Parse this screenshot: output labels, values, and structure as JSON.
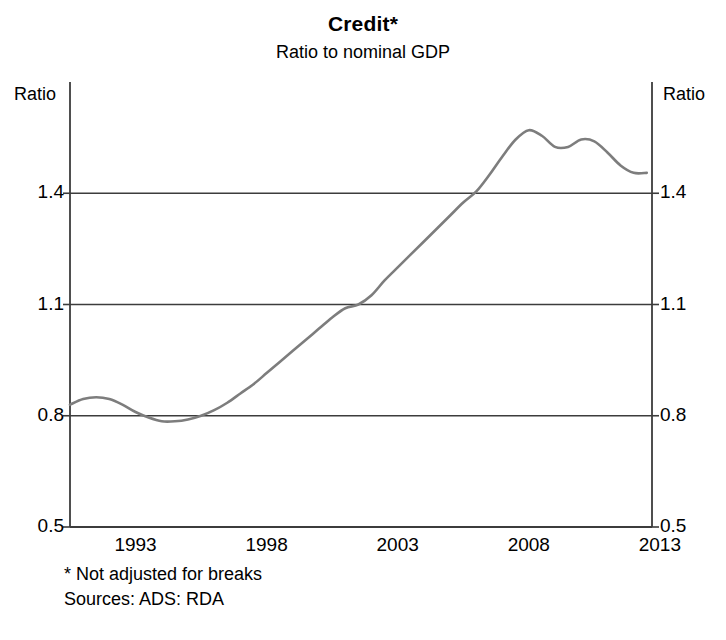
{
  "chart_data": {
    "type": "line",
    "title": "Credit*",
    "subtitle": "Ratio to nominal GDP",
    "xlabel": "",
    "ylabel": "Ratio",
    "ylabel_right": "Ratio",
    "xlim": [
      1990.5,
      2012.7
    ],
    "ylim": [
      0.5,
      1.7
    ],
    "yticks": [
      0.5,
      0.8,
      1.1,
      1.4
    ],
    "ytick_labels": [
      "0.5",
      "0.8",
      "1.1",
      "1.4"
    ],
    "xticks": [
      1993,
      1998,
      2003,
      2008,
      2013
    ],
    "xtick_labels": [
      "1993",
      "1998",
      "2003",
      "2008",
      "2013"
    ],
    "gridlines": "horizontal-at-yticks",
    "legend": "none",
    "line_color": "#7d7d7d",
    "axis_color": "#3c3c3c",
    "series": [
      {
        "name": "Credit to nominal GDP ratio",
        "x": [
          1990.5,
          1991.0,
          1991.5,
          1992.0,
          1992.5,
          1993.0,
          1993.5,
          1994.0,
          1994.5,
          1995.0,
          1995.5,
          1996.0,
          1996.5,
          1997.0,
          1997.5,
          1998.0,
          1998.5,
          1999.0,
          1999.5,
          2000.0,
          2000.5,
          2001.0,
          2001.5,
          2002.0,
          2002.5,
          2003.0,
          2003.5,
          2004.0,
          2004.5,
          2005.0,
          2005.5,
          2006.0,
          2006.5,
          2007.0,
          2007.5,
          2008.0,
          2008.5,
          2009.0,
          2009.5,
          2010.0,
          2010.5,
          2011.0,
          2011.5,
          2012.0,
          2012.5
        ],
        "y": [
          0.83,
          0.845,
          0.85,
          0.845,
          0.83,
          0.81,
          0.795,
          0.785,
          0.785,
          0.79,
          0.8,
          0.815,
          0.835,
          0.86,
          0.885,
          0.915,
          0.945,
          0.975,
          1.005,
          1.035,
          1.065,
          1.09,
          1.1,
          1.125,
          1.165,
          1.2,
          1.235,
          1.27,
          1.305,
          1.34,
          1.375,
          1.405,
          1.45,
          1.5,
          1.545,
          1.57,
          1.555,
          1.525,
          1.525,
          1.545,
          1.54,
          1.51,
          1.475,
          1.455,
          1.455
        ]
      }
    ],
    "annotations": [
      "* Not adjusted for breaks",
      "Sources: ADS: RDA"
    ]
  },
  "footnotes": {
    "note": "* Not adjusted for breaks",
    "sources": "Sources: ADS: RDA"
  }
}
